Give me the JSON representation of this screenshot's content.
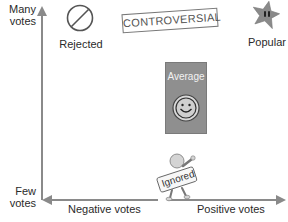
{
  "diagram": {
    "y_axis": {
      "top_label": "Many votes",
      "top_label_lines": [
        "Many",
        "votes"
      ],
      "bottom_label_lines": [
        "Few",
        "votes"
      ]
    },
    "x_axis": {
      "left_label": "Negative votes",
      "right_label": "Positive votes"
    },
    "items": [
      {
        "id": "rejected",
        "label": "Rejected",
        "icon": "prohibited-circle-icon",
        "quadrant": "many-votes-negative"
      },
      {
        "id": "controversial",
        "label": "CONTROVERSIAL",
        "icon": "stamp",
        "quadrant": "many-votes-middle"
      },
      {
        "id": "popular",
        "label": "Popular",
        "icon": "star-icon",
        "quadrant": "many-votes-positive"
      },
      {
        "id": "average",
        "label": "Average",
        "icon": "smiley-icon",
        "quadrant": "center"
      },
      {
        "id": "ignored",
        "label": "Ignored",
        "icon": "figure-holding-sign-icon",
        "quadrant": "few-votes-middle"
      }
    ],
    "colors": {
      "axis": "#8a8a8a",
      "box": "#8f8f8f",
      "star": "#8a8a8a",
      "text": "#2a2a2a"
    }
  }
}
